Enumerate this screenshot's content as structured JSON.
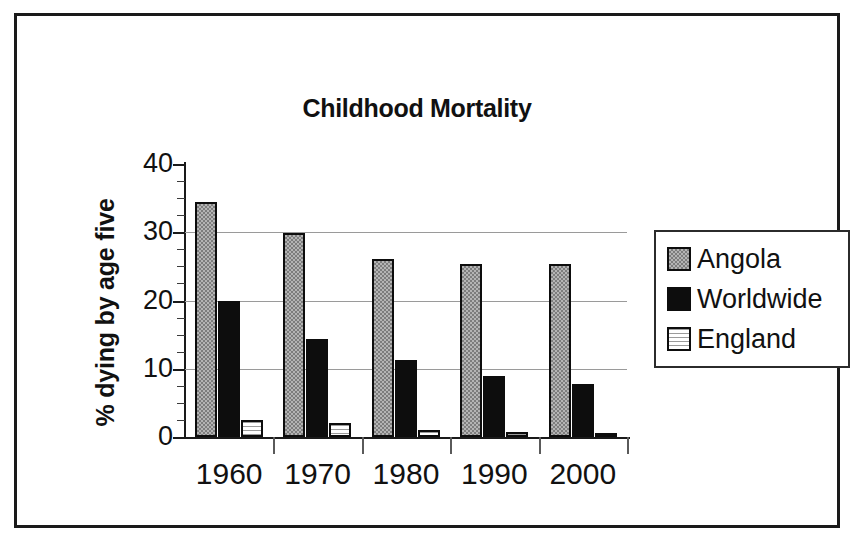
{
  "chart_data": {
    "type": "bar",
    "title": "Childhood Mortality",
    "xlabel": "",
    "ylabel": "% dying by age five",
    "categories": [
      "1960",
      "1970",
      "1980",
      "1990",
      "2000"
    ],
    "series": [
      {
        "name": "Angola",
        "values": [
          34.5,
          29.9,
          26.1,
          25.4,
          25.4
        ],
        "color": "#b4b4b4",
        "pattern": "grey-dither"
      },
      {
        "name": "Worldwide",
        "values": [
          19.9,
          14.4,
          11.3,
          8.9,
          7.7
        ],
        "color": "#0d0d0d",
        "pattern": "solid-black"
      },
      {
        "name": "England",
        "values": [
          2.5,
          2.0,
          1.1,
          0.7,
          0.4
        ],
        "color": "#f2f2f2",
        "pattern": "light-horizontal-lines"
      }
    ],
    "ylim": [
      0,
      40
    ],
    "ytick_labels": [
      "40",
      "30",
      "20",
      "10",
      "0"
    ],
    "ytick_values": [
      40,
      30,
      20,
      10,
      0
    ],
    "ytick_minor_step": 2.5,
    "gridlines": [
      10,
      20,
      30
    ],
    "grid": true,
    "legend_position": "right"
  },
  "legend": {
    "entries": [
      {
        "label": "Angola"
      },
      {
        "label": "Worldwide"
      },
      {
        "label": "England"
      }
    ]
  }
}
